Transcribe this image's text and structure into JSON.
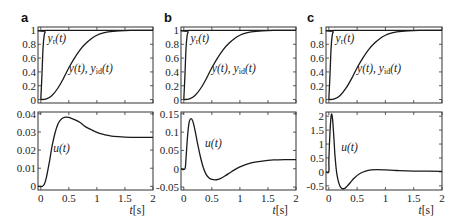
{
  "chart_data": [
    {
      "panel": "a",
      "type": "line",
      "subplots": [
        {
          "id": "a-top",
          "ylim": [
            -0.05,
            1.05
          ],
          "xlim": [
            -0.05,
            2
          ],
          "yticks": [
            0,
            0.2,
            0.4,
            0.6,
            0.8,
            1
          ],
          "yticklabels": [
            "0",
            "0.2",
            "0.4",
            "0.6",
            "0.8",
            "1"
          ],
          "annotations": [
            {
              "id": "yr",
              "text_main": "y",
              "text_sub": "r",
              "text_tail": "(t)",
              "at": [
                0.12,
                0.84
              ]
            },
            {
              "id": "y",
              "text_main": "y(t), y",
              "text_sub": "id",
              "text_tail": "(t)",
              "at": [
                0.5,
                0.4
              ]
            }
          ],
          "series": [
            {
              "name": "y_r(t)",
              "x": [
                0,
                0.02,
                0.04,
                0.06,
                0.08,
                0.1,
                2
              ],
              "y": [
                0,
                0.35,
                0.75,
                0.93,
                0.98,
                1,
                1
              ]
            },
            {
              "name": "y(t), y_id(t)",
              "x": [
                0,
                0.1,
                0.2,
                0.3,
                0.4,
                0.5,
                0.6,
                0.7,
                0.8,
                0.9,
                1.0,
                1.1,
                1.2,
                1.4,
                1.6,
                2
              ],
              "y": [
                0,
                0.01,
                0.06,
                0.16,
                0.3,
                0.46,
                0.6,
                0.72,
                0.81,
                0.88,
                0.93,
                0.96,
                0.98,
                0.995,
                1,
                1
              ]
            }
          ]
        },
        {
          "id": "a-bottom",
          "ylim": [
            -0.002,
            0.041
          ],
          "xlim": [
            -0.05,
            2
          ],
          "yticks": [
            0,
            0.01,
            0.02,
            0.03,
            0.04
          ],
          "yticklabels": [
            "0",
            "0.01",
            "0.02",
            "0.03",
            "0.04"
          ],
          "annotations": [
            {
              "id": "u",
              "text_main": "u(t)",
              "text_sub": "",
              "text_tail": "",
              "at": [
                0.22,
                0.019
              ]
            }
          ],
          "series": [
            {
              "name": "u(t)",
              "x": [
                -0.05,
                0.02,
                0.06,
                0.1,
                0.15,
                0.2,
                0.25,
                0.3,
                0.35,
                0.4,
                0.45,
                0.5,
                0.6,
                0.7,
                0.8,
                0.9,
                1.0,
                1.1,
                1.2,
                1.3,
                1.5,
                1.7,
                2
              ],
              "y": [
                0,
                0,
                0.001,
                0.005,
                0.013,
                0.022,
                0.029,
                0.034,
                0.0365,
                0.0378,
                0.0382,
                0.038,
                0.0368,
                0.0352,
                0.0328,
                0.0312,
                0.0298,
                0.0288,
                0.0281,
                0.0276,
                0.0272,
                0.027,
                0.027
              ]
            }
          ]
        }
      ],
      "xticks": [
        0,
        0.5,
        1,
        1.5,
        2
      ],
      "xticklabels": [
        "0",
        "0.5",
        "1",
        "1.5",
        "2"
      ],
      "xlabel": "t[s]"
    },
    {
      "panel": "b",
      "type": "line",
      "subplots": [
        {
          "id": "b-top",
          "ylim": [
            -0.05,
            1.05
          ],
          "xlim": [
            -0.05,
            2
          ],
          "yticks": [
            0,
            0.2,
            0.4,
            0.6,
            0.8,
            1
          ],
          "yticklabels": [
            "0",
            "0.2",
            "0.4",
            "0.6",
            "0.8",
            "1"
          ],
          "annotations": [
            {
              "id": "yr",
              "text_main": "y",
              "text_sub": "r",
              "text_tail": "(t)",
              "at": [
                0.12,
                0.84
              ]
            },
            {
              "id": "y",
              "text_main": "y(t), y",
              "text_sub": "id",
              "text_tail": "(t)",
              "at": [
                0.5,
                0.4
              ]
            }
          ],
          "series": [
            {
              "name": "y_r(t)",
              "x": [
                0,
                0.02,
                0.04,
                0.06,
                0.08,
                0.1,
                2
              ],
              "y": [
                0,
                0.35,
                0.75,
                0.93,
                0.98,
                1,
                1
              ]
            },
            {
              "name": "y(t), y_id(t)",
              "x": [
                0,
                0.1,
                0.2,
                0.3,
                0.4,
                0.5,
                0.6,
                0.7,
                0.8,
                0.9,
                1.0,
                1.1,
                1.2,
                1.4,
                1.6,
                2
              ],
              "y": [
                0,
                0.01,
                0.06,
                0.16,
                0.3,
                0.46,
                0.6,
                0.72,
                0.81,
                0.88,
                0.93,
                0.96,
                0.98,
                0.995,
                1,
                1
              ]
            }
          ]
        },
        {
          "id": "b-bottom",
          "ylim": [
            -0.058,
            0.155
          ],
          "xlim": [
            -0.05,
            2
          ],
          "yticks": [
            -0.05,
            0,
            0.05,
            0.1,
            0.15
          ],
          "yticklabels": [
            "-0.05",
            "0",
            "0.05",
            "0.1",
            "0.15"
          ],
          "annotations": [
            {
              "id": "u",
              "text_main": "u(t)",
              "text_sub": "",
              "text_tail": "",
              "at": [
                0.38,
                0.06
              ]
            }
          ],
          "series": [
            {
              "name": "u(t)",
              "x": [
                -0.05,
                0.02,
                0.04,
                0.06,
                0.08,
                0.1,
                0.13,
                0.16,
                0.2,
                0.25,
                0.3,
                0.35,
                0.4,
                0.45,
                0.5,
                0.58,
                0.65,
                0.75,
                0.85,
                1.0,
                1.2,
                1.4,
                1.6,
                1.8,
                2
              ],
              "y": [
                0,
                0,
                0.03,
                0.075,
                0.11,
                0.13,
                0.137,
                0.13,
                0.105,
                0.065,
                0.03,
                0.002,
                -0.016,
                -0.025,
                -0.029,
                -0.03,
                -0.027,
                -0.018,
                -0.008,
                0.005,
                0.016,
                0.021,
                0.024,
                0.025,
                0.025
              ]
            }
          ]
        }
      ],
      "xticks": [
        0,
        0.5,
        1,
        1.5,
        2
      ],
      "xticklabels": [
        "0",
        "0.5",
        "1",
        "1.5",
        "2"
      ],
      "xlabel": "t[s]"
    },
    {
      "panel": "c",
      "type": "line",
      "subplots": [
        {
          "id": "c-top",
          "ylim": [
            -0.05,
            1.05
          ],
          "xlim": [
            -0.05,
            2
          ],
          "yticks": [
            0,
            0.2,
            0.4,
            0.6,
            0.8,
            1
          ],
          "yticklabels": [
            "0",
            "0.2",
            "0.4",
            "0.6",
            "0.8",
            "1"
          ],
          "annotations": [
            {
              "id": "yr",
              "text_main": "y",
              "text_sub": "r",
              "text_tail": "(t)",
              "at": [
                0.12,
                0.84
              ]
            },
            {
              "id": "y",
              "text_main": "y(t), y",
              "text_sub": "id",
              "text_tail": "(t)",
              "at": [
                0.5,
                0.4
              ]
            }
          ],
          "series": [
            {
              "name": "y_r(t)",
              "x": [
                0,
                0.02,
                0.04,
                0.06,
                0.08,
                0.1,
                2
              ],
              "y": [
                0,
                0.35,
                0.75,
                0.93,
                0.98,
                1,
                1
              ]
            },
            {
              "name": "y(t), y_id(t)",
              "x": [
                0,
                0.1,
                0.2,
                0.3,
                0.4,
                0.5,
                0.6,
                0.7,
                0.8,
                0.9,
                1.0,
                1.1,
                1.2,
                1.4,
                1.6,
                2
              ],
              "y": [
                0,
                0.01,
                0.06,
                0.16,
                0.3,
                0.46,
                0.6,
                0.72,
                0.81,
                0.88,
                0.93,
                0.96,
                0.98,
                0.995,
                1,
                1
              ]
            }
          ]
        },
        {
          "id": "c-bottom",
          "ylim": [
            -0.65,
            2.15
          ],
          "xlim": [
            -0.05,
            2
          ],
          "yticks": [
            -0.5,
            0,
            0.5,
            1,
            1.5,
            2
          ],
          "yticklabels": [
            "-0.5",
            "0",
            "0.5",
            "1",
            "1.5",
            "2"
          ],
          "annotations": [
            {
              "id": "u",
              "text_main": "u(t)",
              "text_sub": "",
              "text_tail": "",
              "at": [
                0.22,
                0.75
              ]
            }
          ],
          "series": [
            {
              "name": "u(t)",
              "x": [
                -0.05,
                0.0,
                0.001,
                0.02,
                0.04,
                0.055,
                0.07,
                0.09,
                0.11,
                0.14,
                0.18,
                0.22,
                0.27,
                0.32,
                0.38,
                0.45,
                0.55,
                0.65,
                0.75,
                0.85,
                1.0,
                1.2,
                1.5,
                2
              ],
              "y": [
                0,
                0,
                0.45,
                1.4,
                2.0,
                2.05,
                1.8,
                1.2,
                0.55,
                -0.05,
                -0.42,
                -0.58,
                -0.6,
                -0.52,
                -0.38,
                -0.22,
                -0.06,
                0.03,
                0.07,
                0.08,
                0.07,
                0.05,
                0.03,
                0.02
              ]
            }
          ]
        }
      ],
      "xticks": [
        0,
        0.5,
        1,
        1.5,
        2
      ],
      "xticklabels": [
        "0",
        "0.5",
        "1",
        "1.5",
        "2"
      ],
      "xlabel": "t[s]"
    }
  ],
  "panel_labels": [
    "a",
    "b",
    "c"
  ]
}
